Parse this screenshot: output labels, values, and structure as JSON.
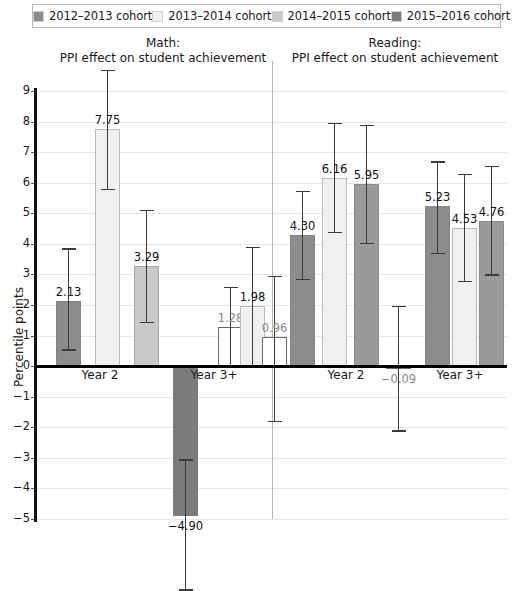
{
  "legend": {
    "items": [
      {
        "label": "2012–2013 cohort",
        "color": "#8c8c8c",
        "name": "legend-swatch-2012-2013"
      },
      {
        "label": "2013–2014 cohort",
        "color": "#f0f0f0",
        "name": "legend-swatch-2013-2014"
      },
      {
        "label": "2014–2015 cohort",
        "color": "#c9c9c9",
        "name": "legend-swatch-2014-2015"
      },
      {
        "label": "2015–2016 cohort",
        "color": "#7c7c7c",
        "name": "legend-swatch-2015-2016"
      }
    ]
  },
  "titles": {
    "math": "Math:\nPPI effect on student achievement",
    "math_line1": "Math:",
    "math_line2": "PPI effect on student achievement",
    "reading_line1": "Reading:",
    "reading_line2": "PPI effect on student achievement"
  },
  "axis": {
    "ylabel": "Percentile points",
    "yticks": [
      "9",
      "8",
      "7",
      "6",
      "5",
      "4",
      "3",
      "2",
      "1",
      "0",
      "−1",
      "−2",
      "−3",
      "−4",
      "−5"
    ],
    "group_labels": [
      "Year 2",
      "Year 3+",
      "Year 2",
      "Year 3+"
    ]
  },
  "chart_data": {
    "type": "bar",
    "title": "PPI effect on student achievement",
    "subtitle": "Math and Reading panels",
    "xlabel": "",
    "ylabel": "Percentile points",
    "ylim": [
      -5,
      9
    ],
    "grid": true,
    "legend_position": "top",
    "panels": [
      "Math",
      "Reading"
    ],
    "categories": [
      "Year 2",
      "Year 3+"
    ],
    "series": [
      {
        "name": "2012–2013 cohort",
        "color": "#8c8c8c"
      },
      {
        "name": "2013–2014 cohort",
        "color": "#f0f0f0"
      },
      {
        "name": "2014–2015 cohort",
        "color": "#c9c9c9"
      },
      {
        "name": "2015–2016 cohort",
        "color": "#7c7c7c"
      }
    ],
    "bars": [
      {
        "panel": "Math",
        "group": "Year 2",
        "series": "2012–2013 cohort",
        "value": 2.13,
        "label": "2.13",
        "ci_low": 0.55,
        "ci_high": 3.85,
        "style": "solid",
        "color": "#8c8c8c"
      },
      {
        "panel": "Math",
        "group": "Year 2",
        "series": "2013–2014 cohort",
        "value": 7.75,
        "label": "7.75",
        "ci_low": 5.8,
        "ci_high": 9.7,
        "style": "solid-light",
        "color": "#f0f0f0"
      },
      {
        "panel": "Math",
        "group": "Year 2",
        "series": "2014–2015 cohort",
        "value": 3.29,
        "label": "3.29",
        "ci_low": 1.44,
        "ci_high": 5.12,
        "style": "hatched",
        "color": "#c9c9c9"
      },
      {
        "panel": "Math",
        "group": "Year 2",
        "series": "2015–2016 cohort",
        "value": -4.9,
        "label": "−4.90",
        "ci_low": -7.3,
        "ci_high": -3.05,
        "style": "hatched",
        "color": "#7c7c7c"
      },
      {
        "panel": "Math",
        "group": "Year 3+",
        "series": "2012–2013 cohort",
        "value": 1.28,
        "label": "1.28",
        "ci_low": 0.0,
        "ci_high": 2.6,
        "style": "hollow",
        "color": "#ffffff"
      },
      {
        "panel": "Math",
        "group": "Year 3+",
        "series": "2013–2014 cohort",
        "value": 1.98,
        "label": "1.98",
        "ci_low": 0.05,
        "ci_high": 3.9,
        "style": "hatched-light",
        "color": "#f0f0f0"
      },
      {
        "panel": "Math",
        "group": "Year 3+",
        "series": "2014–2015 cohort",
        "value": 0.96,
        "label": "0.96",
        "ci_low": -1.8,
        "ci_high": 2.95,
        "style": "hollow",
        "color": "#ffffff"
      },
      {
        "panel": "Reading",
        "group": "Year 2",
        "series": "2012–2013 cohort",
        "value": 4.3,
        "label": "4.30",
        "ci_low": 2.85,
        "ci_high": 5.72,
        "style": "hatched",
        "color": "#8c8c8c"
      },
      {
        "panel": "Reading",
        "group": "Year 2",
        "series": "2013–2014 cohort",
        "value": 6.16,
        "label": "6.16",
        "ci_low": 4.4,
        "ci_high": 7.95,
        "style": "hatched-light",
        "color": "#f0f0f0"
      },
      {
        "panel": "Reading",
        "group": "Year 2",
        "series": "2014–2015 cohort",
        "value": 5.95,
        "label": "5.95",
        "ci_low": 4.02,
        "ci_high": 7.9,
        "style": "hatched",
        "color": "#9a9a9a"
      },
      {
        "panel": "Reading",
        "group": "Year 2",
        "series": "2015–2016 cohort",
        "value": -0.09,
        "label": "−0.09",
        "ci_low": -2.1,
        "ci_high": 1.96,
        "style": "hollow",
        "color": "#ffffff"
      },
      {
        "panel": "Reading",
        "group": "Year 3+",
        "series": "2012–2013 cohort",
        "value": 5.23,
        "label": "5.23",
        "ci_low": 3.7,
        "ci_high": 6.7,
        "style": "hatched",
        "color": "#8c8c8c"
      },
      {
        "panel": "Reading",
        "group": "Year 3+",
        "series": "2013–2014 cohort",
        "value": 4.53,
        "label": "4.53",
        "ci_low": 2.78,
        "ci_high": 6.28,
        "style": "hatched-light",
        "color": "#f0f0f0"
      },
      {
        "panel": "Reading",
        "group": "Year 3+",
        "series": "2014–2015 cohort",
        "value": 4.76,
        "label": "4.76",
        "ci_low": 3.0,
        "ci_high": 6.55,
        "style": "hatched",
        "color": "#9a9a9a"
      }
    ]
  },
  "geometry": {
    "y_top_value": 9,
    "y_top_px": 91,
    "y_bottom_value": -5,
    "y_bottom_px": 519,
    "bar_width": 25,
    "bar_x": [
      56,
      95,
      134,
      173,
      218,
      240,
      262,
      290,
      322,
      354,
      386,
      425,
      452,
      479
    ],
    "group_label_x": [
      100,
      214,
      346,
      460
    ],
    "group_label_y": 368,
    "divider_x": 272
  }
}
